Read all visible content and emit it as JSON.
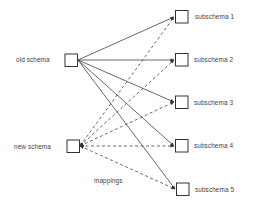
{
  "diagram": {
    "nodes": {
      "old_schema": {
        "label": "old schema"
      },
      "new_schema": {
        "label": "new schema"
      },
      "subschemas": [
        {
          "label": "subschema 1"
        },
        {
          "label": "subschema 2"
        },
        {
          "label": "subschema 3"
        },
        {
          "label": "subschema 4"
        },
        {
          "label": "subschema 5"
        }
      ]
    },
    "edges": {
      "solid_description": "old schema → each subschema",
      "dashed_description": "each subschema → new schema"
    },
    "annotation": "mappings",
    "colors": {
      "line": "#444444",
      "box_stroke": "#333333",
      "background": "#ffffff"
    }
  }
}
